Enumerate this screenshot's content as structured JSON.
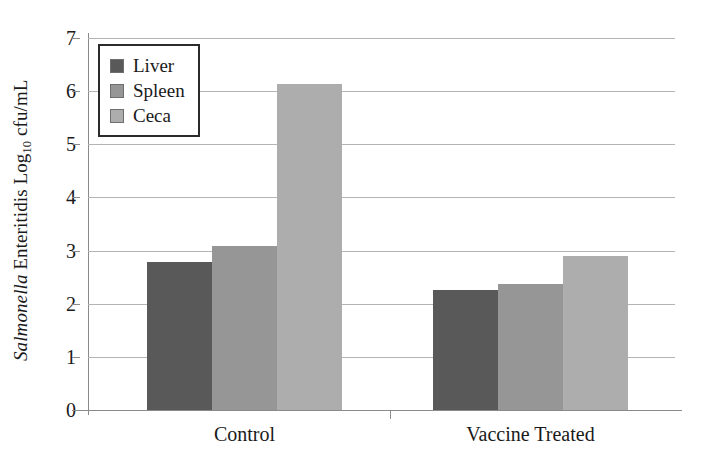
{
  "chart_data": {
    "type": "bar",
    "title": "",
    "xlabel": "",
    "ylabel": "Salmonella Enteritidis Log10 cfu/mL",
    "ylabel_parts": {
      "italic": "Salmonella",
      "roman_before_sub": " Enteritidis Log",
      "subscript": "10",
      "roman_after_sub": " cfu/mL"
    },
    "categories": [
      "Control",
      "Vaccine Treated"
    ],
    "series": [
      {
        "name": "Liver",
        "color": "#595959",
        "values": [
          2.78,
          2.25
        ]
      },
      {
        "name": "Spleen",
        "color": "#969696",
        "values": [
          3.08,
          2.38
        ]
      },
      {
        "name": "Ceca",
        "color": "#adadad",
        "values": [
          6.13,
          2.9
        ]
      }
    ],
    "ylim": [
      0,
      7
    ],
    "yticks": [
      7,
      6,
      5,
      4,
      3,
      2,
      1,
      0
    ],
    "ytick_labels": [
      "7",
      "6",
      "5",
      "4",
      "3",
      "2",
      "1",
      "0"
    ],
    "grid": true,
    "legend_position": "upper left",
    "legend_entries": [
      "Liver",
      "Spleen",
      "Ceca"
    ],
    "colors": {
      "gridline": "#b4b4b4",
      "axis": "#8a8a8a",
      "text": "#1a1a1a",
      "legend_border": "#2b2b2b",
      "background": "#ffffff"
    }
  }
}
